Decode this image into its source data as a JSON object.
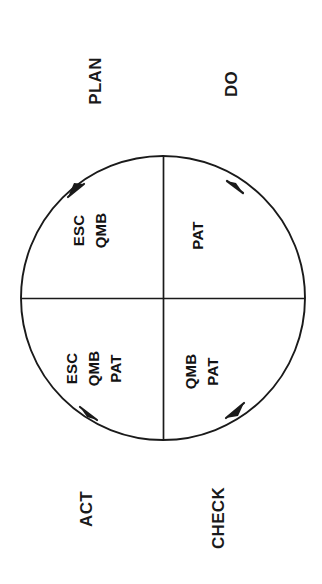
{
  "diagram": {
    "type": "pdca-cycle",
    "background_color": "#ffffff",
    "stroke_color": "#1a1a1a",
    "text_color": "#131313",
    "rotation_note": "Entire figure rotated 90 degrees counter-clockwise on the page",
    "circle": {
      "center_x": 163,
      "center_y": 298,
      "radius": 142,
      "divider_vertical": true,
      "divider_horizontal": true
    },
    "outer_labels": [
      {
        "id": "plan",
        "text": "PLAN",
        "position": "top-left"
      },
      {
        "id": "do",
        "text": "DO",
        "position": "top-right"
      },
      {
        "id": "act",
        "text": "ACT",
        "position": "bottom-left"
      },
      {
        "id": "check",
        "text": "CHECK",
        "position": "bottom-right"
      }
    ],
    "quadrants": [
      {
        "id": "plan-quadrant",
        "stage": "PLAN",
        "position": "top-left",
        "items": [
          "ESC",
          "QMB"
        ]
      },
      {
        "id": "do-quadrant",
        "stage": "DO",
        "position": "top-right",
        "items": [
          "PAT"
        ]
      },
      {
        "id": "act-quadrant",
        "stage": "ACT",
        "position": "bottom-left",
        "items": [
          "ESC",
          "QMB",
          "PAT"
        ]
      },
      {
        "id": "check-quadrant",
        "stage": "CHECK",
        "position": "bottom-right",
        "items": [
          "QMB",
          "PAT"
        ]
      }
    ],
    "arrows": [
      {
        "id": "arrow-top-left",
        "direction": "clockwise",
        "on_arc": "upper-left"
      },
      {
        "id": "arrow-top-right",
        "direction": "clockwise",
        "on_arc": "upper-right"
      },
      {
        "id": "arrow-bottom-right",
        "direction": "clockwise",
        "on_arc": "lower-right"
      },
      {
        "id": "arrow-bottom-left",
        "direction": "clockwise",
        "on_arc": "lower-left"
      }
    ]
  }
}
